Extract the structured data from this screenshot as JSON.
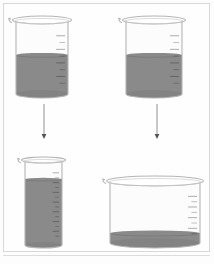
{
  "figure": {
    "type": "conservation-of-volume-diagram",
    "background_color": "#fdfdfd",
    "frame_color": "#d8d8d8",
    "liquid_color": "#8a8a8a",
    "liquid_color_dark": "#7d7d7d",
    "glass_outline_color": "#b4b4b4",
    "glass_fill_color": "#fcfcfc",
    "graduation_color": "#a8a8a8",
    "arrow_color": "#888888"
  },
  "beakers": [
    {
      "id": "top-left",
      "name": "source-beaker-left",
      "shape": "standard",
      "label": "",
      "volume_units": 4,
      "fill_fraction": 0.55,
      "graduation_count": 8,
      "x": 16,
      "y": 20,
      "width": 52,
      "height": 78,
      "rim_ry": 4
    },
    {
      "id": "top-right",
      "name": "source-beaker-right",
      "shape": "standard",
      "label": "",
      "volume_units": 4,
      "fill_fraction": 0.55,
      "graduation_count": 8,
      "x": 126,
      "y": 20,
      "width": 56,
      "height": 78,
      "rim_ry": 4
    },
    {
      "id": "bottom-left",
      "name": "target-beaker-tall-narrow",
      "shape": "tall-narrow",
      "label": "",
      "volume_units": 4,
      "fill_fraction": 0.78,
      "graduation_count": 14,
      "x": 25,
      "y": 160,
      "width": 37,
      "height": 88,
      "rim_ry": 3
    },
    {
      "id": "bottom-right",
      "name": "target-beaker-wide-shallow",
      "shape": "wide-shallow",
      "label": "",
      "volume_units": 4,
      "fill_fraction": 0.22,
      "graduation_count": 8,
      "x": 110,
      "y": 181,
      "width": 90,
      "height": 67,
      "rim_ry": 5
    }
  ],
  "arrows": [
    {
      "id": "arrow-left",
      "name": "pour-arrow-left",
      "direction": "down",
      "from": "top-left",
      "to": "bottom-left",
      "x": 44,
      "y1": 104,
      "y2": 139
    },
    {
      "id": "arrow-right",
      "name": "pour-arrow-right",
      "direction": "down",
      "from": "top-right",
      "to": "bottom-right",
      "x": 157,
      "y1": 104,
      "y2": 139
    }
  ]
}
